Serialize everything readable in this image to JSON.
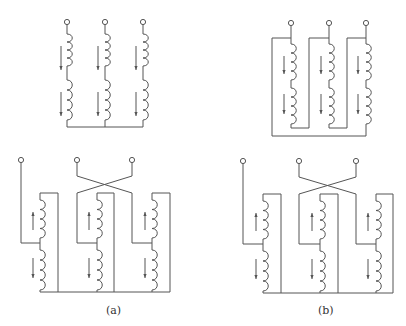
{
  "figure": {
    "stroke_color": "#555555",
    "labels": [
      {
        "id": "a",
        "text": "(a)",
        "x": 106,
        "y": 304
      },
      {
        "id": "b",
        "text": "(b)",
        "x": 318,
        "y": 304
      }
    ]
  },
  "panels": {
    "top_left": {
      "name": "wye-connected windings",
      "terminals": [
        [
          67,
          22
        ],
        [
          113,
          22
        ],
        [
          143,
          22
        ]
      ],
      "phases": [
        {
          "x": 67,
          "coil_upper": [
            34,
            66
          ],
          "coil_lower": [
            80,
            120
          ],
          "arrows": [
            {
              "x": 61,
              "y1": 46,
              "y2": 70,
              "dir": "down"
            },
            {
              "x": 61,
              "y1": 92,
              "y2": 116,
              "dir": "down"
            }
          ]
        },
        {
          "x": 105,
          "coil_upper": [
            34,
            66
          ],
          "coil_lower": [
            80,
            120
          ],
          "arrows": [
            {
              "x": 98,
              "y1": 46,
              "y2": 70,
              "dir": "down"
            },
            {
              "x": 98,
              "y1": 92,
              "y2": 116,
              "dir": "down"
            }
          ]
        },
        {
          "x": 143,
          "coil_upper": [
            34,
            66
          ],
          "coil_lower": [
            80,
            120
          ],
          "arrows": [
            {
              "x": 136,
              "y1": 46,
              "y2": 70,
              "dir": "down"
            },
            {
              "x": 136,
              "y1": 92,
              "y2": 116,
              "dir": "down"
            }
          ]
        }
      ],
      "bus_y": 127
    },
    "top_right": {
      "name": "delta-connected windings",
      "phases": [
        {
          "x": 291,
          "frame_left": 272,
          "coil_upper": [
            44,
            80
          ],
          "coil_lower": [
            88,
            124
          ],
          "arrows": [
            {
              "x": 284,
              "y1": 56,
              "y2": 74,
              "dir": "down"
            },
            {
              "x": 284,
              "y1": 94,
              "y2": 114,
              "dir": "down"
            }
          ]
        },
        {
          "x": 329,
          "frame_left": 309,
          "coil_upper": [
            44,
            80
          ],
          "coil_lower": [
            88,
            124
          ],
          "arrows": [
            {
              "x": 321,
              "y1": 56,
              "y2": 74,
              "dir": "down"
            },
            {
              "x": 321,
              "y1": 94,
              "y2": 114,
              "dir": "down"
            }
          ]
        },
        {
          "x": 366,
          "frame_left": 347,
          "coil_upper": [
            44,
            80
          ],
          "coil_lower": [
            88,
            124
          ],
          "arrows": [
            {
              "x": 358,
              "y1": 56,
              "y2": 74,
              "dir": "down"
            },
            {
              "x": 358,
              "y1": 94,
              "y2": 114,
              "dir": "down"
            }
          ]
        }
      ],
      "terminal_y": 23,
      "frame_top": 38,
      "coil_bottom": 128,
      "bus_y": 136
    },
    "bottom_left": {
      "name": "zigzag connection (a)",
      "terminals": [
        [
          21,
          160
        ],
        [
          77,
          160
        ],
        [
          132,
          160
        ]
      ],
      "cross": {
        "top_y": 176,
        "bottom_y": 193,
        "left_x": 77,
        "right_x": 132
      },
      "phases": [
        {
          "coil_x": 40,
          "frame_right": 58,
          "tap_from_x": 21,
          "coil_upper": [
            200,
            238
          ],
          "coil_lower": [
            250,
            290
          ],
          "arrows": [
            {
              "x": 33,
              "y1": 212,
              "y2": 230,
              "dir": "up"
            },
            {
              "x": 33,
              "y1": 258,
              "y2": 278,
              "dir": "down"
            }
          ]
        },
        {
          "coil_x": 97,
          "frame_right": 114,
          "tap_from_x": 77,
          "coil_upper": [
            200,
            238
          ],
          "coil_lower": [
            250,
            290
          ],
          "arrows": [
            {
              "x": 89,
              "y1": 212,
              "y2": 230,
              "dir": "up"
            },
            {
              "x": 89,
              "y1": 258,
              "y2": 278,
              "dir": "down"
            }
          ]
        },
        {
          "coil_x": 152,
          "frame_right": 170,
          "tap_from_x": 132,
          "coil_upper": [
            200,
            238
          ],
          "coil_lower": [
            250,
            290
          ],
          "arrows": [
            {
              "x": 145,
              "y1": 212,
              "y2": 230,
              "dir": "up"
            },
            {
              "x": 145,
              "y1": 258,
              "y2": 278,
              "dir": "down"
            }
          ]
        }
      ],
      "frame_top": 193,
      "tap_y": 243,
      "bus_y": 292
    },
    "bottom_right": {
      "name": "zigzag connection (b)",
      "terminals": [
        [
          243,
          161
        ],
        [
          299,
          161
        ],
        [
          356,
          161
        ]
      ],
      "cross": {
        "top_y": 177,
        "bottom_y": 194,
        "left_x": 299,
        "right_x": 356
      },
      "phases": [
        {
          "coil_x": 263,
          "frame_right": 281,
          "tap_from_x": 243,
          "coil_upper": [
            201,
            239
          ],
          "coil_lower": [
            251,
            291
          ],
          "arrows": [
            {
              "x": 256,
              "y1": 213,
              "y2": 231,
              "dir": "up"
            },
            {
              "x": 256,
              "y1": 259,
              "y2": 279,
              "dir": "down"
            }
          ]
        },
        {
          "coil_x": 320,
          "frame_right": 338,
          "tap_from_x": 299,
          "coil_upper": [
            201,
            239
          ],
          "coil_lower": [
            251,
            291
          ],
          "arrows": [
            {
              "x": 312,
              "y1": 213,
              "y2": 231,
              "dir": "up"
            },
            {
              "x": 312,
              "y1": 259,
              "y2": 279,
              "dir": "down"
            }
          ]
        },
        {
          "coil_x": 376,
          "frame_right": 393,
          "tap_from_x": 356,
          "coil_upper": [
            201,
            239
          ],
          "coil_lower": [
            251,
            291
          ],
          "arrows": [
            {
              "x": 368,
              "y1": 213,
              "y2": 231,
              "dir": "up"
            },
            {
              "x": 368,
              "y1": 259,
              "y2": 279,
              "dir": "down"
            }
          ]
        }
      ],
      "frame_top": 194,
      "tap_y": 244,
      "bus_y": 293
    }
  }
}
